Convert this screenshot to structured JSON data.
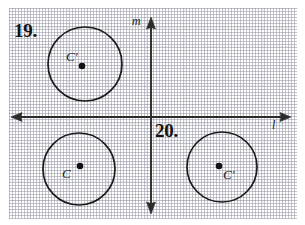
{
  "page": {
    "background_color": "#ffffff",
    "grid_color": "#96969f",
    "ink_color": "#1b1b1b"
  },
  "problems": [
    {
      "number": "19.",
      "name": "problem-19-label"
    },
    {
      "number": "20.",
      "name": "problem-20-label"
    }
  ],
  "axes": {
    "vertical_label": "m",
    "horizontal_label": "l",
    "origin": {
      "x": 151,
      "y": 117
    },
    "vertical": {
      "x": 151,
      "y_top": 18,
      "y_bottom": 212
    },
    "horizontal": {
      "y": 117,
      "x_left": 11,
      "x_right": 290
    },
    "arrowheads": [
      "up",
      "down",
      "left",
      "right"
    ]
  },
  "circles": [
    {
      "name": "circle-upper-left",
      "label": "C′",
      "cx": 85,
      "cy": 64,
      "r": 37,
      "center_dot": {
        "x": 82,
        "y": 66,
        "r": 3.2
      },
      "label_position": "above-left"
    },
    {
      "name": "circle-lower-left",
      "label": "C",
      "cx": 79,
      "cy": 169,
      "r": 36,
      "center_dot": {
        "x": 80,
        "y": 166,
        "r": 3.2
      },
      "label_position": "below-left"
    },
    {
      "name": "circle-lower-right",
      "label": "C′",
      "cx": 222,
      "cy": 167,
      "r": 35,
      "center_dot": {
        "x": 219,
        "y": 166,
        "r": 3.2
      },
      "label_position": "below-right"
    }
  ]
}
